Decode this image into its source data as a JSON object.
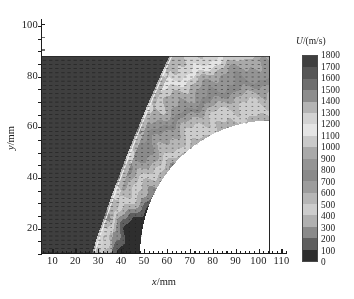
{
  "figure": {
    "type": "contour-vector-field",
    "background": "#ffffff"
  },
  "axes": {
    "x": {
      "title_symbol": "x",
      "title_sep": "/",
      "title_unit": "mm",
      "min": 5,
      "max": 112,
      "ticks": [
        10,
        20,
        30,
        40,
        50,
        60,
        70,
        80,
        90,
        100,
        110
      ],
      "tick_labels": [
        "10",
        "20",
        "30",
        "40",
        "50",
        "60",
        "70",
        "80",
        "90",
        "100",
        "110"
      ],
      "minor_step": 2
    },
    "y": {
      "title_symbol": "y",
      "title_sep": "/",
      "title_unit": "mm",
      "min": 9.3,
      "max": 102,
      "ticks": [
        20,
        40,
        60,
        80,
        100
      ],
      "tick_labels": [
        "20",
        "40",
        "60",
        "80",
        "100"
      ],
      "minor_step": 5
    }
  },
  "colorbar": {
    "symbol": "U",
    "sep": "/",
    "unit": "(m/s)",
    "label": "U/(m/s)",
    "min": 0,
    "max": 1800,
    "step": 100,
    "tick_labels": [
      "1800",
      "1700",
      "1600",
      "1500",
      "1400",
      "1300",
      "1200",
      "1100",
      "1000",
      "900",
      "800",
      "700",
      "600",
      "500",
      "400",
      "300",
      "200",
      "100",
      "0"
    ],
    "band_colors_top_to_bottom": [
      "#3f3f3f",
      "#565656",
      "#6f6f6f",
      "#8d8d8d",
      "#b4b4b4",
      "#d2d2d2",
      "#e4e4e4",
      "#c9c9c9",
      "#a9a9a9",
      "#949494",
      "#8a8a8a",
      "#9d9d9d",
      "#b6b6b6",
      "#cccccc",
      "#b0b0b0",
      "#8a8a8a",
      "#5f5f5f",
      "#2e2e2e"
    ]
  },
  "chart_data": {
    "type": "heatmap",
    "title": "",
    "xlabel": "x/mm",
    "ylabel": "y/mm",
    "zlabel": "U/(m/s)",
    "xlim": [
      5,
      112
    ],
    "ylim": [
      9.3,
      102
    ],
    "zlim": [
      0,
      1800
    ],
    "grid": false,
    "legend_position": "right",
    "field_domain": {
      "x_min": 10,
      "x_max": 107,
      "y_min": 9.3,
      "y_max": 85
    },
    "levels": [
      0,
      100,
      200,
      300,
      400,
      500,
      600,
      700,
      800,
      900,
      1000,
      1100,
      1200,
      1300,
      1400,
      1500,
      1600,
      1700,
      1800
    ],
    "features": [
      {
        "name": "freestream-upstream-region",
        "x_range": [
          10,
          33
        ],
        "value_approx": 1750,
        "shade": "#3c3c3c"
      },
      {
        "name": "bow-shock-front",
        "description": "bright curved shock layer rising from (33,10) to (63,85)",
        "value_approx": 1350,
        "shade": "#e6e6e6"
      },
      {
        "name": "post-shock-high-speed-band",
        "x_range": [
          45,
          78
        ],
        "value_approx": 1300,
        "shade": "#cfcfcf"
      },
      {
        "name": "subsonic-recirculation-pocket",
        "x_range": [
          40,
          55
        ],
        "y_range": [
          12,
          38
        ],
        "value_approx": 600,
        "shade": "#7a7a7a"
      },
      {
        "name": "stagnation-core-near-body",
        "x_range": [
          50,
          58
        ],
        "y_range": [
          9,
          30
        ],
        "value_approx": 250,
        "shade": "#4a4a4a"
      },
      {
        "name": "body-blanked-region",
        "description": "white quarter-ellipse, no data, lower-right",
        "center": [
          107,
          9.3
        ],
        "radius_x": 55,
        "radius_y": 51
      },
      {
        "name": "outer-wake-gradient",
        "x_range": [
          63,
          107
        ],
        "value_approx": 1500,
        "shade": "#b9b9b9"
      }
    ],
    "vector_overlay": {
      "present": true,
      "description": "columns of short horizontal velocity vectors pointing in +x",
      "column_spacing_mm": 2.6,
      "row_spacing_mm": 1.6,
      "color": "#151515"
    }
  }
}
